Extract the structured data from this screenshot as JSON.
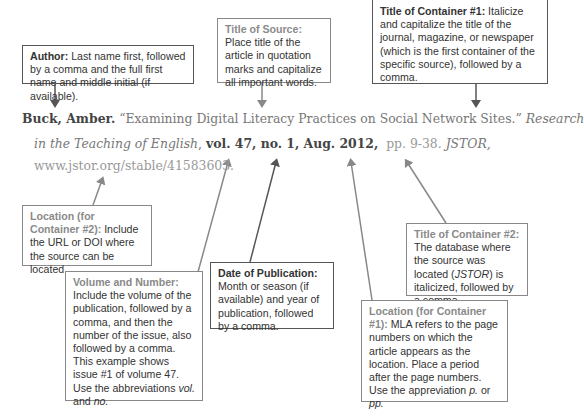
{
  "citation": {
    "line1": {
      "author": "Buck, Amber.",
      "title": " “Examining Digital Literacy Practices on Social Network Sites.” ",
      "container_start": "Research"
    },
    "line2": {
      "container_end": "in the Teaching of English",
      "comma": ", ",
      "volume_number": "vol. 47, no. 1,",
      "date": " Aug. 2012,",
      "pages": "  pp. 9-38.",
      "database": " JSTOR,"
    },
    "line3": {
      "url": "www.jstor.org/stable/41583603."
    }
  },
  "annotations": {
    "author": {
      "label": "Author:",
      "text": " Last name first, followed by a comma and the full first name and middle initial (if available)."
    },
    "title_of_source": {
      "label": "Title of Source:",
      "text": " Place title of the article in quotation marks and capitalize all important words."
    },
    "title_container_1": {
      "label": "Title of Container #1:",
      "text": " Italicize and capitalize the title of the journal, magazine, or newspaper (which is the first container of the specific source), followed by a comma."
    },
    "location_container_2": {
      "label": "Location (for Container #2):",
      "text": " Include the URL or DOI where the source can be located."
    },
    "volume_number": {
      "label": "Volume and Number:",
      "text_a": " Include the volume of the publication, followed by a comma, and then the number of the issue, also followed by a comma. This example shows issue #1 of volume 47. Use the abbreviations ",
      "em1": "vol.",
      "and": " and ",
      "em2": "no."
    },
    "date_of_publication": {
      "label": "Date of Publication:",
      "text": " Month or season (if available) and year of publication, followed by a comma."
    },
    "title_container_2": {
      "label": "Title of Container #2:",
      "text_a": " The database where the source was located (",
      "em": "JSTOR",
      "text_b": ") is italicized, followed by a comma."
    },
    "location_container_1": {
      "label": "Location (for Container #1):",
      "text_a": " MLA refers to the page numbers on which the article appears as the location. Place a period after the page numbers. Use the appreviation ",
      "em1": "p.",
      "or": " or ",
      "em2": "pp."
    }
  }
}
